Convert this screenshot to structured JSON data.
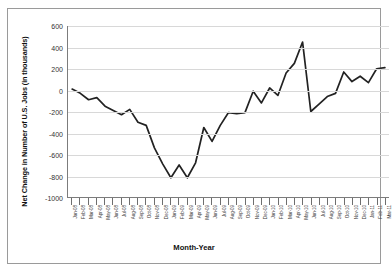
{
  "chart_data": {
    "type": "line",
    "title": "",
    "xlabel": "Month-Year",
    "ylabel": "Net Change in Number of U.S. Jobs (in thousands)",
    "ylim": [
      -1000,
      600
    ],
    "yticks": [
      600,
      400,
      200,
      0,
      -200,
      -400,
      -600,
      -800,
      -1000
    ],
    "grid": true,
    "legend": "none",
    "series_name": "Net change in U.S. jobs",
    "line_color": "#222222",
    "categories": [
      "Jan-08",
      "Feb-08",
      "Mar-08",
      "Apr-08",
      "May-08",
      "Jun-08",
      "Jul-08",
      "Aug-08",
      "Sep-08",
      "Oct-08",
      "Nov-08",
      "Dec-08",
      "Jan-09",
      "Feb-09",
      "Mar-09",
      "Apr-09",
      "May-09",
      "Jun-09",
      "Jul-09",
      "Aug-09",
      "Sep-09",
      "Oct-09",
      "Nov-09",
      "Dec-09",
      "Jan-10",
      "Feb-10",
      "Mar-10",
      "Apr-10",
      "May-10",
      "Jun-10",
      "Jul-10",
      "Aug-10",
      "Sep-10",
      "Oct-10",
      "Nov-10",
      "Dec-10",
      "Jan-11",
      "Feb-11",
      "Mar-11"
    ],
    "values": [
      10,
      -30,
      -90,
      -70,
      -150,
      -190,
      -230,
      -180,
      -300,
      -330,
      -540,
      -690,
      -820,
      -700,
      -820,
      -680,
      -350,
      -480,
      -330,
      -210,
      -220,
      -210,
      -10,
      -120,
      20,
      -50,
      160,
      250,
      450,
      -200,
      -130,
      -60,
      -30,
      170,
      80,
      130,
      70,
      200,
      210
    ]
  }
}
